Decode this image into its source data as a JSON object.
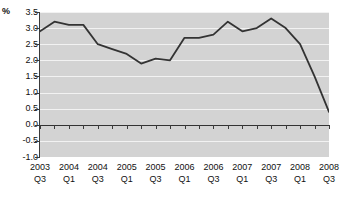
{
  "chart_data": {
    "type": "line",
    "title": "",
    "xlabel": "",
    "ylabel": "%",
    "ylim": [
      -1.0,
      3.5
    ],
    "ytick_labels": [
      "3.5",
      "3.0",
      "2.5",
      "2.0",
      "1.5",
      "1.0",
      "0.5",
      "0.0",
      "-0.5",
      "-1.0"
    ],
    "ytick_values": [
      3.5,
      3.0,
      2.5,
      2.0,
      1.5,
      1.0,
      0.5,
      0.0,
      -0.5,
      -1.0
    ],
    "grid": true,
    "legend": "none",
    "plot_background": "#d3d3d3",
    "gridline_color": "#f2f2f2",
    "series_color": "#333333",
    "zero_line_color": "#333333",
    "categories": [
      "2003 Q3",
      "2003 Q4",
      "2004 Q1",
      "2004 Q2",
      "2004 Q3",
      "2004 Q4",
      "2005 Q1",
      "2005 Q2",
      "2005 Q3",
      "2005 Q4",
      "2006 Q1",
      "2006 Q2",
      "2006 Q3",
      "2006 Q4",
      "2007 Q1",
      "2007 Q2",
      "2007 Q3",
      "2007 Q4",
      "2008 Q1",
      "2008 Q2",
      "2008 Q3"
    ],
    "values": [
      2.9,
      3.2,
      3.1,
      3.1,
      2.5,
      2.35,
      2.2,
      1.9,
      2.05,
      2.0,
      2.7,
      2.7,
      2.8,
      3.2,
      2.9,
      3.0,
      3.3,
      3.0,
      2.5,
      1.5,
      0.4
    ],
    "xtick_labels": [
      {
        "year": "2003",
        "quarter": "Q3"
      },
      {
        "year": "2004",
        "quarter": "Q1"
      },
      {
        "year": "2004",
        "quarter": "Q3"
      },
      {
        "year": "2005",
        "quarter": "Q1"
      },
      {
        "year": "2005",
        "quarter": "Q3"
      },
      {
        "year": "2006",
        "quarter": "Q1"
      },
      {
        "year": "2006",
        "quarter": "Q3"
      },
      {
        "year": "2007",
        "quarter": "Q1"
      },
      {
        "year": "2007",
        "quarter": "Q3"
      },
      {
        "year": "2008",
        "quarter": "Q1"
      },
      {
        "year": "2008",
        "quarter": "Q3"
      }
    ]
  }
}
